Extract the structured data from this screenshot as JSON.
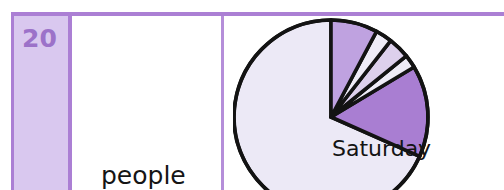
{
  "table": {
    "row_header": {
      "value": "20",
      "background_color": "#d9c8ef",
      "text_color": "#9c72c9",
      "border_color": "#ab7fd4"
    },
    "unit_cell": {
      "label": "people"
    },
    "divider_color": "#b58ed9",
    "top_border_color": "#ab7fd4"
  },
  "chart_data": {
    "type": "pie",
    "title": "",
    "subtitle": "",
    "xlabel": "",
    "ylabel": "",
    "grid": false,
    "legend_position": "none",
    "start_angle_deg": 0,
    "direction": "counterclockwise",
    "center": {
      "x": 98,
      "y": 100
    },
    "radius": 97,
    "annotations": [
      {
        "text": "Saturday",
        "target_slice": "Saturday"
      }
    ],
    "slices": [
      {
        "label": "Saturday",
        "value": 246,
        "angle_deg": 246,
        "color": "#ece9f6",
        "labeled": true,
        "label_text": "Saturday"
      },
      {
        "label": "",
        "value": 55,
        "angle_deg": 55,
        "color": "#a97ed2",
        "labeled": false,
        "label_text": ""
      },
      {
        "label": "",
        "value": 8,
        "angle_deg": 8,
        "color": "#efecf7",
        "labeled": false,
        "label_text": ""
      },
      {
        "label": "",
        "value": 13,
        "angle_deg": 13,
        "color": "#ddd0ec",
        "labeled": false,
        "label_text": ""
      },
      {
        "label": "",
        "value": 10,
        "angle_deg": 10,
        "color": "#efecf7",
        "labeled": false,
        "label_text": ""
      },
      {
        "label": "",
        "value": 28,
        "angle_deg": 28,
        "color": "#bfa2e0",
        "labeled": false,
        "label_text": ""
      }
    ],
    "slice_outline_color": "#131313",
    "total": 360
  }
}
